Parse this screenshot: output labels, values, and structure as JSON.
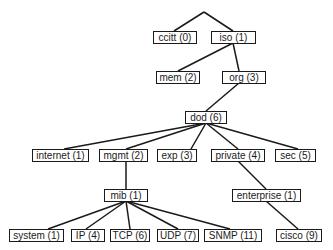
{
  "diagram": {
    "type": "tree",
    "title": "",
    "nodes": [
      {
        "id": "ccitt",
        "label": "ccitt (0)",
        "x": 153,
        "y": 31,
        "w": 44
      },
      {
        "id": "iso",
        "label": "iso (1)",
        "x": 211,
        "y": 31,
        "w": 45
      },
      {
        "id": "mem",
        "label": "mem (2)",
        "x": 156,
        "y": 71,
        "w": 44
      },
      {
        "id": "org",
        "label": "org (3)",
        "x": 222,
        "y": 71,
        "w": 44
      },
      {
        "id": "dod",
        "label": "dod (6)",
        "x": 185,
        "y": 111,
        "w": 42
      },
      {
        "id": "internet",
        "label": "internet (1)",
        "x": 32,
        "y": 149,
        "w": 57
      },
      {
        "id": "mgmt",
        "label": "mgmt (2)",
        "x": 99,
        "y": 149,
        "w": 49
      },
      {
        "id": "exp",
        "label": "exp (3)",
        "x": 157,
        "y": 149,
        "w": 40
      },
      {
        "id": "private",
        "label": "private (4)",
        "x": 211,
        "y": 149,
        "w": 54
      },
      {
        "id": "sec",
        "label": "sec (5)",
        "x": 275,
        "y": 149,
        "w": 41
      },
      {
        "id": "mib",
        "label": "mib (1)",
        "x": 104,
        "y": 189,
        "w": 44
      },
      {
        "id": "enterprise",
        "label": "enterprise (1)",
        "x": 232,
        "y": 189,
        "w": 69
      },
      {
        "id": "system",
        "label": "system (1)",
        "x": 9,
        "y": 229,
        "w": 55
      },
      {
        "id": "ip",
        "label": "IP (4)",
        "x": 71,
        "y": 229,
        "w": 34
      },
      {
        "id": "tcp",
        "label": "TCP (6)",
        "x": 110,
        "y": 229,
        "w": 40
      },
      {
        "id": "udp",
        "label": "UDP (7)",
        "x": 157,
        "y": 229,
        "w": 42
      },
      {
        "id": "snmp",
        "label": "SNMP (11)",
        "x": 204,
        "y": 229,
        "w": 58
      },
      {
        "id": "cisco",
        "label": "cisco (9)",
        "x": 276,
        "y": 229,
        "w": 46
      }
    ],
    "edges": [
      {
        "x1": 204,
        "y1": 12,
        "x2": 174,
        "y2": 31
      },
      {
        "x1": 204,
        "y1": 12,
        "x2": 233,
        "y2": 31
      },
      {
        "x1": 233,
        "y1": 43,
        "x2": 178,
        "y2": 71
      },
      {
        "x1": 233,
        "y1": 43,
        "x2": 239,
        "y2": 71
      },
      {
        "x1": 239,
        "y1": 83,
        "x2": 206,
        "y2": 111
      },
      {
        "x1": 206,
        "y1": 123,
        "x2": 64,
        "y2": 149
      },
      {
        "x1": 206,
        "y1": 123,
        "x2": 126,
        "y2": 149
      },
      {
        "x1": 206,
        "y1": 123,
        "x2": 191,
        "y2": 149
      },
      {
        "x1": 206,
        "y1": 123,
        "x2": 238,
        "y2": 149
      },
      {
        "x1": 206,
        "y1": 123,
        "x2": 298,
        "y2": 149
      },
      {
        "x1": 126,
        "y1": 161,
        "x2": 126,
        "y2": 189
      },
      {
        "x1": 238,
        "y1": 161,
        "x2": 266,
        "y2": 189
      },
      {
        "x1": 126,
        "y1": 201,
        "x2": 48,
        "y2": 229
      },
      {
        "x1": 126,
        "y1": 201,
        "x2": 86,
        "y2": 229
      },
      {
        "x1": 126,
        "y1": 201,
        "x2": 130,
        "y2": 229
      },
      {
        "x1": 126,
        "y1": 201,
        "x2": 178,
        "y2": 229
      },
      {
        "x1": 126,
        "y1": 201,
        "x2": 230,
        "y2": 229
      },
      {
        "x1": 266,
        "y1": 201,
        "x2": 298,
        "y2": 229
      }
    ]
  }
}
